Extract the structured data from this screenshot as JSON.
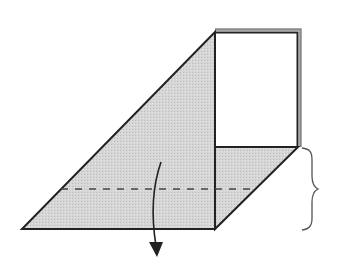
{
  "diagram": {
    "type": "origami-fold-step",
    "colors": {
      "background": "#ffffff",
      "paper_shaded": "#d4d4d4",
      "paper_white": "#ffffff",
      "outline": "#222222",
      "edge_shadow": "#8a8a8a",
      "fold_line": "#444444",
      "arrow": "#222222",
      "brace": "#555555"
    },
    "shapes": {
      "triangle_flap": {
        "points": [
          [
            215,
            32
          ],
          [
            22,
            229
          ],
          [
            215,
            229
          ]
        ],
        "fill": "shaded"
      },
      "white_panel": {
        "x": 215,
        "y": 32,
        "width": 83,
        "height": 115,
        "fill": "white"
      },
      "lower_parallelogram": {
        "points": [
          [
            215,
            147
          ],
          [
            298,
            147
          ],
          [
            215,
            229
          ]
        ],
        "fill": "shaded"
      },
      "dashed_fold_line": {
        "x1": 61,
        "y1": 189,
        "x2": 251,
        "y2": 189,
        "style": "dashed"
      },
      "fold_arrow": {
        "start": [
          161,
          162
        ],
        "end": [
          157,
          256
        ],
        "direction": "down"
      },
      "brace": {
        "x": 302,
        "y_top": 147,
        "y_mid": 189,
        "y_bottom": 229,
        "meaning": "two equal sections"
      }
    }
  }
}
